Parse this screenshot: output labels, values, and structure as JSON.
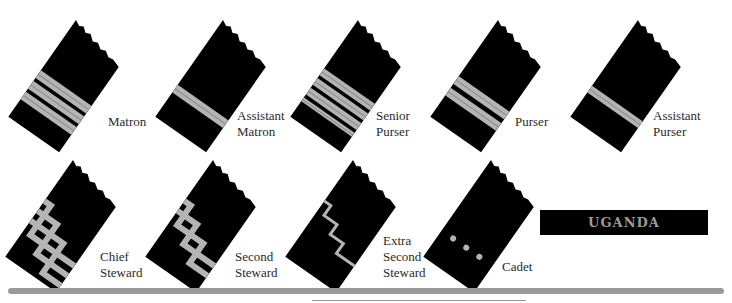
{
  "colors": {
    "cloth": "#000000",
    "braid": "#b4b4b4",
    "braid_dark": "#8a8a8a",
    "label_text": "#2a2a2a",
    "nameplate_text": "#9a9a9a",
    "rule": "#9a9a9a"
  },
  "badges": [
    {
      "id": "matron",
      "label": "Matron",
      "x": 18,
      "y": 18,
      "insignia": "stripes",
      "stripes": [
        [
          0.52,
          0.08
        ],
        [
          0.63,
          0.08
        ],
        [
          0.74,
          0.08
        ]
      ],
      "label_x": 108,
      "label_y": 114
    },
    {
      "id": "assistant-matron",
      "label": "Assistant\nMatron",
      "x": 165,
      "y": 18,
      "insignia": "stripes",
      "stripes": [
        [
          0.67,
          0.08
        ]
      ],
      "label_x": 237,
      "label_y": 108
    },
    {
      "id": "senior-purser",
      "label": "Senior\nPurser",
      "x": 300,
      "y": 18,
      "insignia": "stripes",
      "stripes": [
        [
          0.5,
          0.07
        ],
        [
          0.6,
          0.07
        ],
        [
          0.7,
          0.07
        ],
        [
          0.8,
          0.04
        ]
      ],
      "label_x": 376,
      "label_y": 108
    },
    {
      "id": "purser",
      "label": "Purser",
      "x": 440,
      "y": 18,
      "insignia": "stripes",
      "stripes": [
        [
          0.58,
          0.08
        ],
        [
          0.7,
          0.08
        ]
      ],
      "label_x": 515,
      "label_y": 114
    },
    {
      "id": "assistant-purser",
      "label": "Assistant\nPurser",
      "x": 580,
      "y": 18,
      "insignia": "stripes",
      "stripes": [
        [
          0.68,
          0.07
        ]
      ],
      "label_x": 653,
      "label_y": 108
    },
    {
      "id": "chief-steward",
      "label": "Chief\nSteward",
      "x": 15,
      "y": 158,
      "insignia": "zigzag",
      "zigzags": 3,
      "label_x": 100,
      "label_y": 249
    },
    {
      "id": "second-steward",
      "label": "Second\nSteward",
      "x": 155,
      "y": 158,
      "insignia": "zigzag",
      "zigzags": 2,
      "label_x": 235,
      "label_y": 249
    },
    {
      "id": "extra-second-steward",
      "label": "Extra\nSecond\nSteward",
      "x": 295,
      "y": 158,
      "insignia": "zigzag",
      "zigzags": 1,
      "thin": true,
      "label_x": 383,
      "label_y": 233
    },
    {
      "id": "cadet",
      "label": "Cadet",
      "x": 433,
      "y": 158,
      "insignia": "dots",
      "label_x": 502,
      "label_y": 259
    }
  ],
  "nameplate": {
    "text": "UGANDA"
  }
}
